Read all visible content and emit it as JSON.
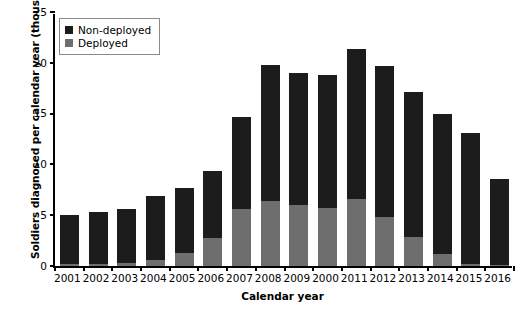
{
  "chart_data": {
    "type": "bar",
    "stacked": true,
    "title": "",
    "xlabel": "Calendar year",
    "ylabel": "Soldiers diagnosed per calendar year (thousands)",
    "categories": [
      "2001",
      "2002",
      "2003",
      "2004",
      "2005",
      "2006",
      "2007",
      "2008",
      "2009",
      "2000",
      "2011",
      "2012",
      "2013",
      "2014",
      "2015",
      "2016"
    ],
    "series": [
      {
        "name": "Deployed",
        "color": "#6e6e6e",
        "values": [
          0.2,
          0.2,
          0.3,
          0.6,
          1.3,
          2.8,
          5.6,
          6.4,
          6.0,
          5.7,
          6.6,
          4.8,
          2.9,
          1.2,
          0.2,
          0.1
        ]
      },
      {
        "name": "Non-deployed",
        "color": "#1c1c1c",
        "values": [
          4.8,
          5.1,
          5.3,
          6.3,
          6.4,
          6.6,
          9.1,
          13.4,
          13.0,
          13.1,
          14.8,
          14.9,
          14.2,
          13.8,
          12.9,
          8.5
        ]
      }
    ],
    "totals": [
      5.0,
      5.3,
      5.6,
      6.9,
      7.7,
      9.4,
      14.7,
      19.8,
      19.0,
      18.8,
      21.4,
      19.7,
      17.1,
      15.0,
      13.1,
      8.6
    ],
    "yticks": [
      0,
      5,
      10,
      15,
      20,
      25
    ],
    "ylim": [
      0,
      25
    ],
    "grid": false,
    "legend_position": "top-left",
    "legend_entries": [
      "Non-deployed",
      "Deployed"
    ]
  }
}
